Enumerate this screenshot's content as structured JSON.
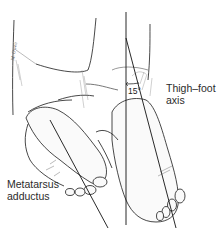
{
  "figure": {
    "labels": {
      "thigh_foot_axis_line1": "Thigh–foot",
      "thigh_foot_axis_line2": "axis",
      "metatarsus_line1": "Metatarsus",
      "metatarsus_line2": "adductus",
      "angle": "15°"
    },
    "signature": "M. Owen",
    "colors": {
      "ink": "#1a1a1a",
      "shade": "#c8c8c8",
      "background": "#ffffff",
      "label": "#2b2b2b"
    }
  }
}
